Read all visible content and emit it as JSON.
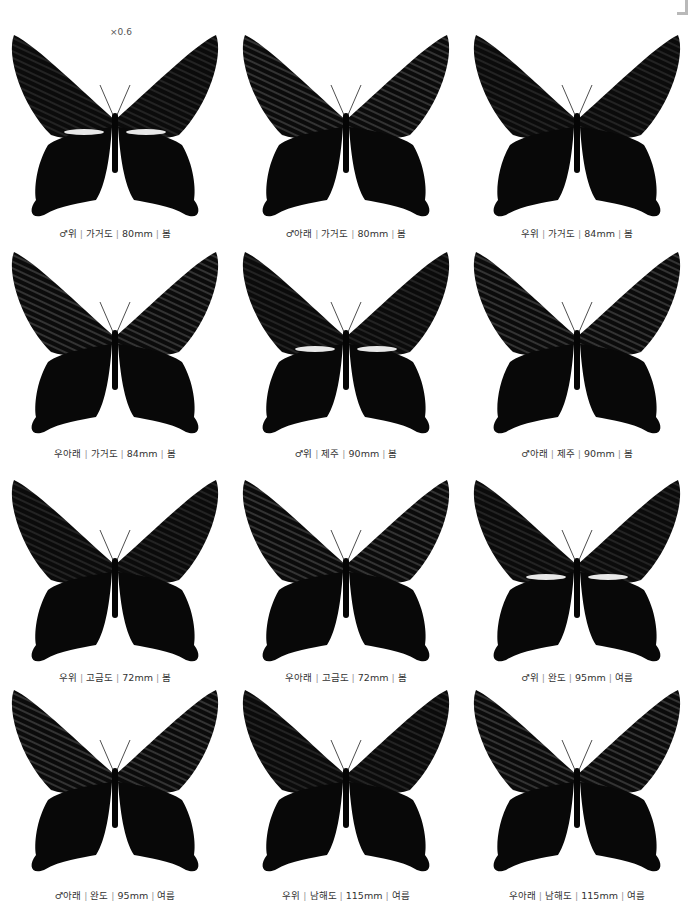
{
  "page": {
    "scale_label": "×0.6",
    "separator": "|",
    "colors": {
      "wing": "#0b0b0b",
      "vein": "#3a3a3a",
      "band": "#e8e8e8",
      "caption": "#333333"
    }
  },
  "specimens": [
    {
      "sex_side": "♂위",
      "locality": "가거도",
      "size": "80mm",
      "season": "봄",
      "view": "upper",
      "band": true
    },
    {
      "sex_side": "♂아래",
      "locality": "가거도",
      "size": "80mm",
      "season": "봄",
      "view": "under",
      "band": false
    },
    {
      "sex_side": "우위",
      "locality": "가거도",
      "size": "84mm",
      "season": "봄",
      "view": "upper",
      "band": false
    },
    {
      "sex_side": "우아래",
      "locality": "가거도",
      "size": "84mm",
      "season": "봄",
      "view": "under",
      "band": false
    },
    {
      "sex_side": "♂위",
      "locality": "제주",
      "size": "90mm",
      "season": "봄",
      "view": "upper",
      "band": true
    },
    {
      "sex_side": "♂아래",
      "locality": "제주",
      "size": "90mm",
      "season": "봄",
      "view": "under",
      "band": false
    },
    {
      "sex_side": "우위",
      "locality": "고금도",
      "size": "72mm",
      "season": "봄",
      "view": "upper",
      "band": false
    },
    {
      "sex_side": "우아래",
      "locality": "고금도",
      "size": "72mm",
      "season": "봄",
      "view": "under",
      "band": false
    },
    {
      "sex_side": "♂위",
      "locality": "완도",
      "size": "95mm",
      "season": "여름",
      "view": "upper",
      "band": true
    },
    {
      "sex_side": "♂아래",
      "locality": "완도",
      "size": "95mm",
      "season": "여름",
      "view": "under",
      "band": false
    },
    {
      "sex_side": "우위",
      "locality": "남해도",
      "size": "115mm",
      "season": "여름",
      "view": "upper",
      "band": false
    },
    {
      "sex_side": "우아래",
      "locality": "남해도",
      "size": "115mm",
      "season": "여름",
      "view": "under",
      "band": false
    }
  ]
}
